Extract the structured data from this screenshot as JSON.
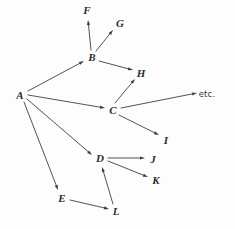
{
  "diagram": {
    "background_color": "#fdfdfd",
    "edge_color": "#3f3f3f",
    "label_color": "#2b2b2b",
    "edge_width": 0.9,
    "arrowhead_length": 5.0,
    "arrowhead_width": 3.2,
    "width": 235,
    "height": 229
  },
  "chart_data": {
    "type": "diagram",
    "graph_kind": "directed-graph",
    "title": "",
    "node_count": 13,
    "edge_count": 14,
    "nodes": [
      {
        "id": "A",
        "label": "A",
        "x": 20,
        "y": 95,
        "style": "italic-serif"
      },
      {
        "id": "B",
        "label": "B",
        "x": 92,
        "y": 57,
        "style": "italic-serif"
      },
      {
        "id": "C",
        "label": "C",
        "x": 113,
        "y": 110,
        "style": "italic-serif"
      },
      {
        "id": "D",
        "label": "D",
        "x": 100,
        "y": 158,
        "style": "italic-serif"
      },
      {
        "id": "E",
        "label": "E",
        "x": 62,
        "y": 198,
        "style": "italic-serif"
      },
      {
        "id": "F",
        "label": "F",
        "x": 87,
        "y": 10,
        "style": "italic-serif"
      },
      {
        "id": "G",
        "label": "G",
        "x": 120,
        "y": 23,
        "style": "italic-serif"
      },
      {
        "id": "H",
        "label": "H",
        "x": 141,
        "y": 73,
        "style": "italic-serif"
      },
      {
        "id": "I",
        "label": "I",
        "x": 166,
        "y": 140,
        "style": "italic-serif"
      },
      {
        "id": "J",
        "label": "J",
        "x": 153,
        "y": 159,
        "style": "italic-serif"
      },
      {
        "id": "K",
        "label": "K",
        "x": 156,
        "y": 180,
        "style": "italic-serif"
      },
      {
        "id": "L",
        "label": "L",
        "x": 116,
        "y": 211,
        "style": "italic-serif"
      },
      {
        "id": "ETC",
        "label": "etc.",
        "x": 207,
        "y": 94,
        "style": "upright-sans"
      }
    ],
    "edges": [
      {
        "from": "A",
        "to": "B",
        "x1": 28,
        "y1": 91,
        "x2": 84,
        "y2": 61,
        "directed": true
      },
      {
        "from": "A",
        "to": "C",
        "x1": 28,
        "y1": 95,
        "x2": 105,
        "y2": 108,
        "directed": true
      },
      {
        "from": "A",
        "to": "D",
        "x1": 27,
        "y1": 99,
        "x2": 92,
        "y2": 155,
        "directed": true
      },
      {
        "from": "A",
        "to": "E",
        "x1": 24,
        "y1": 102,
        "x2": 58,
        "y2": 190,
        "directed": true
      },
      {
        "from": "B",
        "to": "F",
        "x1": 91,
        "y1": 50,
        "x2": 88,
        "y2": 20,
        "directed": true
      },
      {
        "from": "B",
        "to": "G",
        "x1": 96,
        "y1": 51,
        "x2": 113,
        "y2": 30,
        "directed": true
      },
      {
        "from": "B",
        "to": "H",
        "x1": 99,
        "y1": 61,
        "x2": 133,
        "y2": 70,
        "directed": true
      },
      {
        "from": "C",
        "to": "H",
        "x1": 115,
        "y1": 103,
        "x2": 135,
        "y2": 79,
        "directed": true
      },
      {
        "from": "C",
        "to": "ETC",
        "x1": 121,
        "y1": 108,
        "x2": 197,
        "y2": 93,
        "directed": true
      },
      {
        "from": "C",
        "to": "I",
        "x1": 119,
        "y1": 115,
        "x2": 159,
        "y2": 135,
        "directed": true
      },
      {
        "from": "D",
        "to": "J",
        "x1": 108,
        "y1": 158,
        "x2": 145,
        "y2": 158,
        "directed": true
      },
      {
        "from": "D",
        "to": "K",
        "x1": 108,
        "y1": 161,
        "x2": 148,
        "y2": 177,
        "directed": true
      },
      {
        "from": "E",
        "to": "L",
        "x1": 70,
        "y1": 200,
        "x2": 109,
        "y2": 209,
        "directed": true
      },
      {
        "from": "L",
        "to": "D",
        "x1": 113,
        "y1": 204,
        "x2": 102,
        "y2": 167,
        "directed": true
      }
    ],
    "adjacency": {
      "A": [
        "B",
        "C",
        "D",
        "E"
      ],
      "B": [
        "F",
        "G",
        "H"
      ],
      "C": [
        "H",
        "etc.",
        "I"
      ],
      "D": [
        "J",
        "K"
      ],
      "E": [
        "L"
      ],
      "L": [
        "D"
      ],
      "F": [],
      "G": [],
      "H": [],
      "I": [],
      "J": [],
      "K": [],
      "etc.": []
    }
  }
}
